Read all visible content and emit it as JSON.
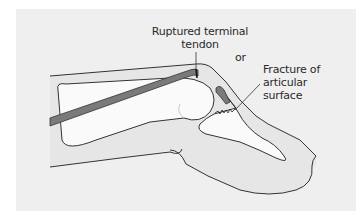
{
  "diagram": {
    "labels": {
      "ruptured_tendon": "Ruptured terminal tendon",
      "or": "or",
      "fracture": "Fracture of articular surface"
    },
    "colors": {
      "background_panel": "#efefef",
      "bone_fill": "#fafafa",
      "tissue_fill": "#e6e6e6",
      "tendon_fill": "#7a7a7a",
      "outline": "#333333",
      "label_text": "#2a2a2a"
    }
  }
}
